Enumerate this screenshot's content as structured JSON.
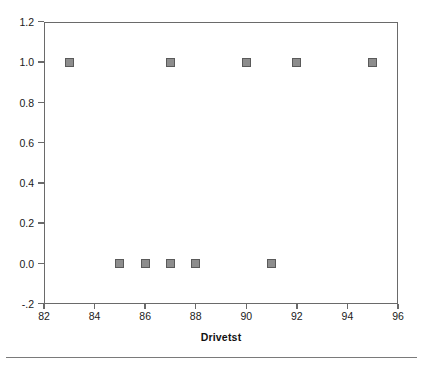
{
  "chart_data": {
    "type": "scatter",
    "title": "",
    "subtitle": "",
    "xlabel": "Drivetst",
    "ylabel": "",
    "xlim": [
      82,
      96
    ],
    "ylim": [
      -0.2,
      1.2
    ],
    "xticks": [
      82,
      84,
      86,
      88,
      90,
      92,
      94,
      96
    ],
    "xtick_labels": [
      "82",
      "84",
      "86",
      "88",
      "90",
      "92",
      "94",
      "96"
    ],
    "yticks": [
      1.2,
      1.0,
      0.8,
      0.6,
      0.4,
      0.2,
      0.0,
      -0.2
    ],
    "ytick_labels": [
      "1.2",
      "1.0",
      "0.8",
      "0.6",
      "0.4",
      "0.2",
      "0.0",
      "-.2"
    ],
    "grid": false,
    "legend": "none",
    "marker": "square",
    "marker_fill": "#8d8d8d",
    "marker_edge": "#5a5a5a",
    "frame_color": "#6a6a6a",
    "background": "#ffffff",
    "points": [
      {
        "x": 83,
        "y": 1.0
      },
      {
        "x": 87,
        "y": 1.0
      },
      {
        "x": 90,
        "y": 1.0
      },
      {
        "x": 92,
        "y": 1.0
      },
      {
        "x": 95,
        "y": 1.0
      },
      {
        "x": 85,
        "y": 0.0
      },
      {
        "x": 86,
        "y": 0.0
      },
      {
        "x": 87,
        "y": 0.0
      },
      {
        "x": 88,
        "y": 0.0
      },
      {
        "x": 91,
        "y": 0.0
      }
    ]
  }
}
